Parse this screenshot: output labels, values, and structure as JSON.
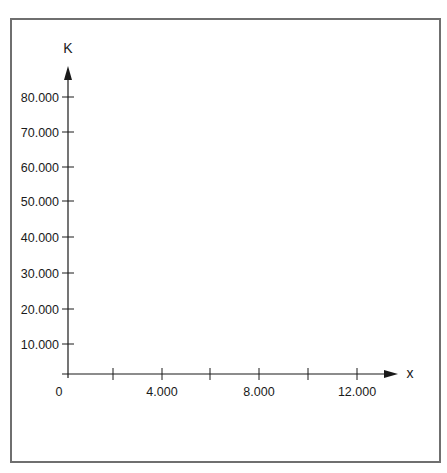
{
  "chart_data": {
    "type": "line",
    "title": "",
    "xlabel": "x",
    "ylabel": "K",
    "x_ticks": [
      {
        "value": 0,
        "label": "0",
        "px": 68
      },
      {
        "value": 2000,
        "label": "",
        "px": 113
      },
      {
        "value": 4000,
        "label": "4.000",
        "px": 162
      },
      {
        "value": 6000,
        "label": "",
        "px": 210
      },
      {
        "value": 8000,
        "label": "8.000",
        "px": 259
      },
      {
        "value": 10000,
        "label": "",
        "px": 308
      },
      {
        "value": 12000,
        "label": "12.000",
        "px": 357
      }
    ],
    "y_ticks": [
      {
        "value": 10000,
        "label": "10.000",
        "py": 344
      },
      {
        "value": 20000,
        "label": "20.000",
        "py": 309
      },
      {
        "value": 30000,
        "label": "30.000",
        "py": 273
      },
      {
        "value": 40000,
        "label": "40.000",
        "py": 237
      },
      {
        "value": 50000,
        "label": "50.000",
        "py": 201
      },
      {
        "value": 60000,
        "label": "60.000",
        "py": 167
      },
      {
        "value": 70000,
        "label": "70.000",
        "py": 132
      },
      {
        "value": 80000,
        "label": "80.000",
        "py": 97
      }
    ],
    "xlim": [
      0,
      13500
    ],
    "ylim": [
      0,
      88000
    ],
    "series": [],
    "grid": false,
    "legend": null,
    "colors": {
      "axis": "#1a1a1a",
      "frame": "#6f6f6f"
    }
  }
}
